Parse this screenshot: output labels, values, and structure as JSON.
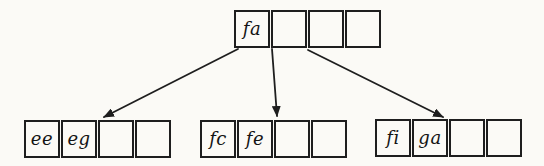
{
  "diagram": {
    "type": "b-tree",
    "root": {
      "cells": [
        "fa",
        "",
        "",
        ""
      ]
    },
    "children": [
      {
        "cells": [
          "ee",
          "eg",
          "",
          ""
        ]
      },
      {
        "cells": [
          "fc",
          "fe",
          "",
          ""
        ]
      },
      {
        "cells": [
          "fi",
          "ga",
          "",
          ""
        ]
      }
    ],
    "edges": [
      {
        "from": "root",
        "to": "left-child"
      },
      {
        "from": "root",
        "to": "middle-child"
      },
      {
        "from": "root",
        "to": "right-child"
      }
    ]
  },
  "colors": {
    "background": "#fbfaf6",
    "line": "#1e1e1e",
    "text": "#141414"
  }
}
